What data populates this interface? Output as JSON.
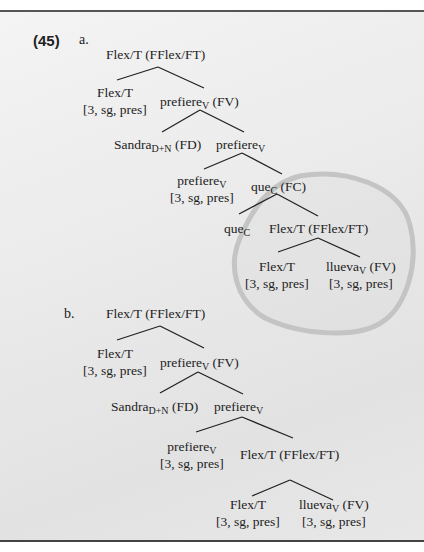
{
  "example_number": "(45)",
  "trees": [
    {
      "label": "a.",
      "nodes": {
        "root": {
          "text": "Flex/T (FFlex/FT)"
        },
        "flex_head": {
          "line1": "Flex/T",
          "line2": "[3, sg, pres]"
        },
        "fv": {
          "base": "prefiere",
          "sub": "V",
          "suffix": " (FV)"
        },
        "sandra": {
          "base": "Sandra",
          "sub": "D+N",
          "suffix": " (FD)"
        },
        "v_bar": {
          "base": "prefiere",
          "sub": "V"
        },
        "v_head": {
          "base": "prefiere",
          "sub": "V",
          "line2": "[3, sg, pres]"
        },
        "fc": {
          "base": "que",
          "sub": "C",
          "suffix": " (FC)"
        },
        "c_head": {
          "base": "que",
          "sub": "C"
        },
        "embedded_root": {
          "text": "Flex/T (FFlex/FT)"
        },
        "embedded_flex": {
          "line1": "Flex/T",
          "line2": "[3, sg, pres]"
        },
        "embedded_fv": {
          "base": "llueva",
          "sub": "V",
          "suffix": " (FV)",
          "line2": "[3, sg, pres]"
        }
      },
      "annotation": "hand-drawn circle around embedded clause"
    },
    {
      "label": "b.",
      "nodes": {
        "root": {
          "text": "Flex/T (FFlex/FT)"
        },
        "flex_head": {
          "line1": "Flex/T",
          "line2": "[3, sg, pres]"
        },
        "fv": {
          "base": "prefiere",
          "sub": "V",
          "suffix": " (FV)"
        },
        "sandra": {
          "base": "Sandra",
          "sub": "D+N",
          "suffix": " (FD)"
        },
        "v_bar": {
          "base": "prefiere",
          "sub": "V"
        },
        "v_head": {
          "base": "prefiere",
          "sub": "V",
          "line2": "[3, sg, pres]"
        },
        "embedded_root": {
          "text": "Flex/T (FFlex/FT)"
        },
        "embedded_flex": {
          "line1": "Flex/T",
          "line2": "[3, sg, pres]"
        },
        "embedded_fv": {
          "base": "llueva",
          "sub": "V",
          "suffix": " (FV)",
          "line2": "[3, sg, pres]"
        }
      }
    }
  ]
}
